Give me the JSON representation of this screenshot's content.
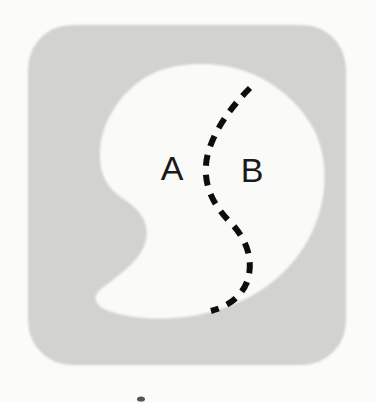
{
  "figure": {
    "canvas": {
      "width": 376,
      "height": 403
    }
  },
  "colors": {
    "paper_background": "#fbfbfa",
    "halftone_gray": "#c9c9c9",
    "halftone_dot": "#a8a8a8",
    "region_fill": "#fafaf8",
    "ink": "#171717",
    "dashed_curve": "#111111"
  },
  "background_panel": {
    "name": "rounded-square-shaded-panel",
    "shape": "rounded-square",
    "x": 28,
    "y": 25,
    "width": 318,
    "height": 340,
    "corner_radius": 44,
    "fill_style": "halftone-dots"
  },
  "region_outline": {
    "name": "kidney-shaped-region",
    "shape": "kidney",
    "fill": "white",
    "path": "M 196 64 C 247 62 291 88 313 128 C 331 161 327 206 308 240 C 288 276 254 300 214 311 C 176 322 134 320 109 311 C 94 306 92 296 101 289 C 122 273 142 259 146 240 C 150 219 136 207 122 198 C 106 187 99 172 100 152 C 101 124 117 98 140 81 C 156 69 176 65 196 64 Z"
  },
  "divider": {
    "name": "dashed-partition-curve",
    "style": "dashed",
    "dash_pattern": "11 9",
    "stroke_width": 6,
    "path": "M 250 88 C 231 107 215 129 208 153 C 201 180 211 203 230 222 C 248 240 254 262 247 282 C 240 299 226 307 211 311"
  },
  "labels": [
    {
      "name": "region-label-a",
      "text": "A",
      "x": 172,
      "y": 180,
      "font_size": 34,
      "region": "left"
    },
    {
      "name": "region-label-b",
      "text": "B",
      "x": 252,
      "y": 182,
      "font_size": 34,
      "region": "right"
    }
  ],
  "artifacts": {
    "name": "scan-speck",
    "present": true,
    "x": 141,
    "y": 399
  }
}
